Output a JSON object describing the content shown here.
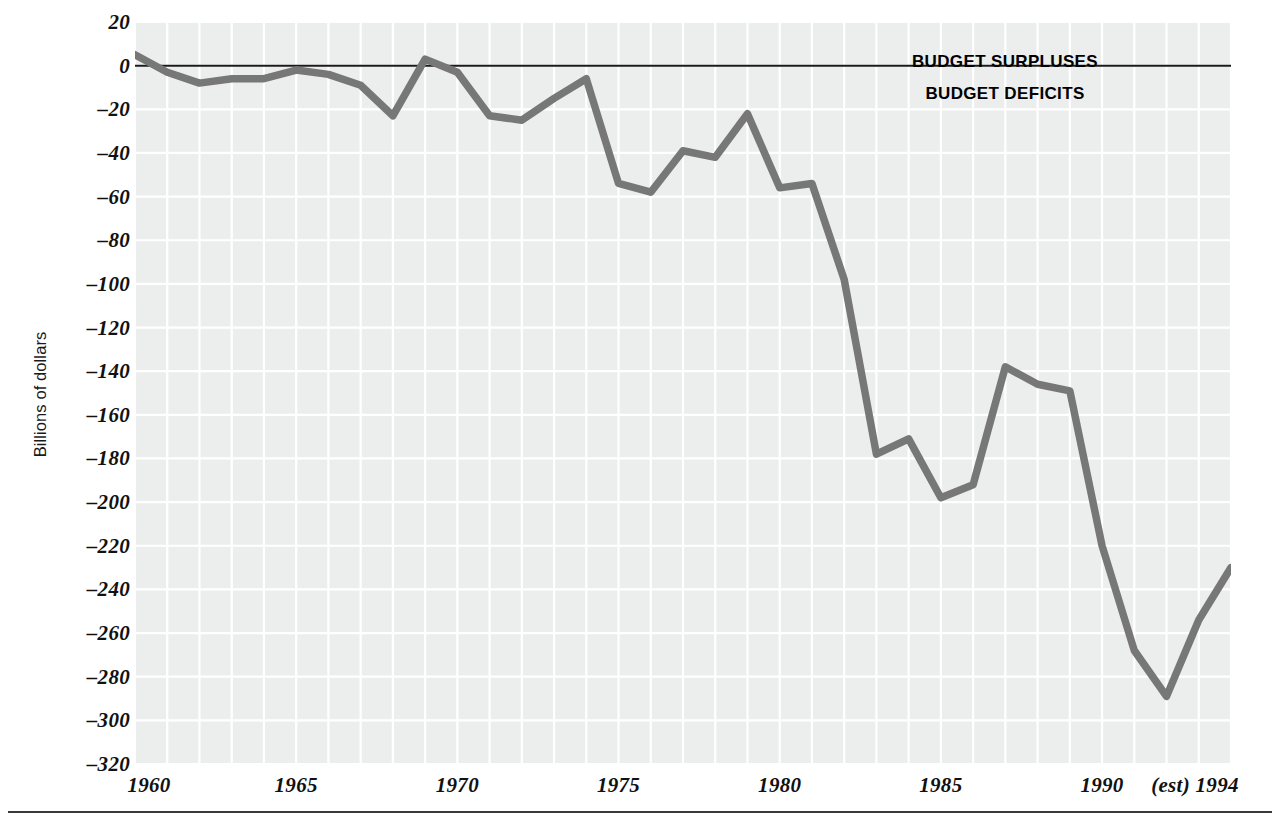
{
  "chart_data": {
    "type": "line",
    "title": "",
    "subtitle": "",
    "xlabel": "",
    "ylabel": "Billions of dollars",
    "xlim": [
      1960,
      1994
    ],
    "ylim": [
      -320,
      20
    ],
    "grid": true,
    "legend_position": "none",
    "y_tick_labels": [
      "20",
      "0",
      "–20",
      "–40",
      "–60",
      "–80",
      "–100",
      "–120",
      "–140",
      "–160",
      "–180",
      "–200",
      "–220",
      "–240",
      "–260",
      "–280",
      "–300",
      "–320"
    ],
    "y_tick_values": [
      20,
      0,
      -20,
      -40,
      -60,
      -80,
      -100,
      -120,
      -140,
      -160,
      -180,
      -200,
      -220,
      -240,
      -260,
      -280,
      -300,
      -320
    ],
    "x_tick_labels": [
      "1960",
      "1965",
      "1970",
      "1975",
      "1980",
      "1985",
      "1990",
      "(est) 1994"
    ],
    "x_tick_values": [
      1960,
      1965,
      1970,
      1975,
      1980,
      1985,
      1990,
      1994
    ],
    "x": [
      1960,
      1961,
      1962,
      1963,
      1964,
      1965,
      1966,
      1967,
      1968,
      1969,
      1970,
      1971,
      1972,
      1973,
      1974,
      1975,
      1976,
      1977,
      1978,
      1979,
      1980,
      1981,
      1982,
      1983,
      1984,
      1985,
      1986,
      1987,
      1988,
      1989,
      1990,
      1991,
      1992,
      1993,
      1994
    ],
    "values": [
      5,
      -3,
      -8,
      -6,
      -6,
      -2,
      -4,
      -9,
      -23,
      3,
      -3,
      -23,
      -25,
      -15,
      -6,
      -54,
      -58,
      -39,
      -42,
      -22,
      -56,
      -54,
      -98,
      -178,
      -171,
      -198,
      -192,
      -138,
      -146,
      -149,
      -220,
      -268,
      -289,
      -254,
      -230
    ],
    "annotations": [
      {
        "text": "BUDGET SURPLUSES",
        "x": 1990,
        "y": 12
      },
      {
        "text": "BUDGET DEFICITS",
        "x": 1990,
        "y": -8
      }
    ],
    "zero_line": 0,
    "series_name": "Federal budget surplus/deficit",
    "line_color": "#777777",
    "panel_color": "#eceded",
    "grid_color": "#ffffff",
    "zero_line_color": "#1a1a1a"
  },
  "axes": {
    "y_label": "Billions of dollars",
    "y_ticks": [
      {
        "label": "20",
        "value": 20
      },
      {
        "label": "0",
        "value": 0
      },
      {
        "label": "–20",
        "value": -20
      },
      {
        "label": "–40",
        "value": -40
      },
      {
        "label": "–60",
        "value": -60
      },
      {
        "label": "–80",
        "value": -80
      },
      {
        "label": "–100",
        "value": -100
      },
      {
        "label": "–120",
        "value": -120
      },
      {
        "label": "–140",
        "value": -140
      },
      {
        "label": "–160",
        "value": -160
      },
      {
        "label": "–180",
        "value": -180
      },
      {
        "label": "–200",
        "value": -200
      },
      {
        "label": "–220",
        "value": -220
      },
      {
        "label": "–240",
        "value": -240
      },
      {
        "label": "–260",
        "value": -260
      },
      {
        "label": "–280",
        "value": -280
      },
      {
        "label": "–300",
        "value": -300
      },
      {
        "label": "–320",
        "value": -320
      }
    ],
    "x_ticks": [
      {
        "label": "1960",
        "value": 1960
      },
      {
        "label": "1965",
        "value": 1965
      },
      {
        "label": "1970",
        "value": 1970
      },
      {
        "label": "1975",
        "value": 1975
      },
      {
        "label": "1980",
        "value": 1980
      },
      {
        "label": "1985",
        "value": 1985
      },
      {
        "label": "1990",
        "value": 1990
      },
      {
        "label": "(est) 1994",
        "value": 1994
      }
    ]
  },
  "annotations": {
    "surpluses": "BUDGET SURPLUSES",
    "deficits": "BUDGET DEFICITS"
  }
}
